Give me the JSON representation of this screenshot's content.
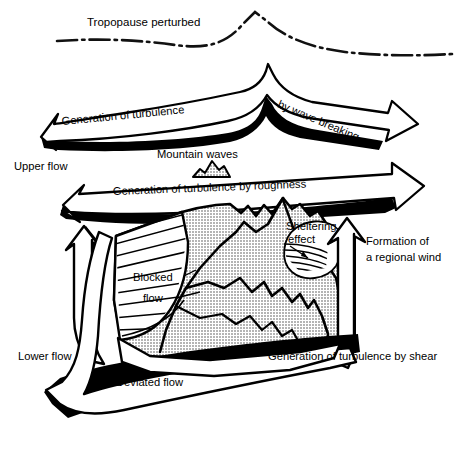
{
  "figure": {
    "type": "schematic-diagram",
    "width": 462,
    "height": 456,
    "background": "#ffffff",
    "ink": "#000000",
    "terrain_fill": "#c9c9c9",
    "terrain_fill_light": "#d9d9d9"
  },
  "labels": {
    "tropopause": "Tropopause perturbed",
    "generation_of_turbulence": "Generation of turbulence",
    "by_wave_breaking": "by wave breaking",
    "mountain_waves": "Mountain waves",
    "upper_flow": "Upper flow",
    "turbulence_by_roughness": "Generation of turbulence by roughness",
    "sheltering_effect_line1": "Sheltering",
    "sheltering_effect_line2": "effect",
    "formation_line1": "Formation of",
    "formation_line2": "a regional wind",
    "blocked_flow_line1": "Blocked",
    "blocked_flow_line2": "flow",
    "lower_flow": "Lower flow",
    "deviated_flow": "Deviated flow",
    "turbulence_by_shear": "Generation of turbulence by shear"
  },
  "elements": {
    "tropopause_line": "dash-dot curve peaking near centre",
    "upper_arrow": "wavy right-pointing block arrow with wave break",
    "roughness_arrow": "long right-pointing block arrow",
    "mountain_waves_icon": "small shaded peak",
    "massif": "shaded mountain massif with hatched blocked-flow flank",
    "sheltering_callout": "oval callout with fan lines",
    "left_up_arrow": "vertical up arrow left of massif",
    "right_up_arrow": "vertical up arrow right of massif",
    "lower_arrow": "curved block arrow sweeping to lower left"
  }
}
